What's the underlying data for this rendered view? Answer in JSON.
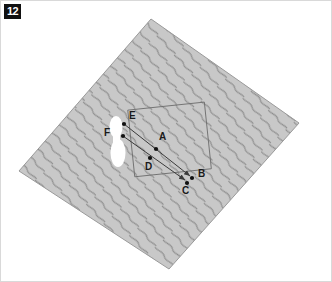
{
  "figure": {
    "number": "12",
    "label_color": "#111111",
    "label_text_color": "#ffffff"
  },
  "frame": {
    "border_color": "#d9d9d9",
    "background": "#ffffff",
    "width": 332,
    "height": 282
  },
  "diagram": {
    "name": "rotated-textured-square-with-labeled-points",
    "fill_color": "#c8c8c8",
    "texture_color": "#8c8c8c",
    "texture_type": "vertical-wavy-lines",
    "outline_color": "#9a9a9a",
    "square_corners": [
      {
        "x": 150,
        "y": 18
      },
      {
        "x": 298,
        "y": 122
      },
      {
        "x": 168,
        "y": 268
      },
      {
        "x": 18,
        "y": 170
      }
    ],
    "inner_rectangle": {
      "color": "#6e6e6e",
      "corners": [
        {
          "x": 130,
          "y": 105
        },
        {
          "x": 207,
          "y": 105
        },
        {
          "x": 207,
          "y": 172
        },
        {
          "x": 130,
          "y": 172
        }
      ]
    },
    "blobs": [
      {
        "name": "upper-white-blob",
        "cx": 115,
        "cy": 126,
        "rx": 6.5,
        "ry": 11,
        "color": "#ffffff"
      },
      {
        "name": "lower-white-blob",
        "cx": 117,
        "cy": 152,
        "rx": 7.5,
        "ry": 14,
        "color": "#ffffff"
      }
    ],
    "arrows": [
      {
        "name": "arrow-e-to-b",
        "from": "E",
        "to": "B",
        "x1": 123,
        "y1": 123,
        "x2": 191,
        "y2": 177,
        "color": "#3a3a3a"
      },
      {
        "name": "arrow-f-to-c",
        "from": "F",
        "to": "C",
        "x1": 122,
        "y1": 135,
        "x2": 186,
        "y2": 181,
        "color": "#3a3a3a"
      }
    ],
    "points": [
      {
        "id": "A",
        "label": "A",
        "x": 155,
        "y": 148,
        "label_x": 158,
        "label_y": 136
      },
      {
        "id": "B",
        "label": "B",
        "x": 191,
        "y": 177,
        "label_x": 197,
        "label_y": 172
      },
      {
        "id": "C",
        "label": "C",
        "x": 186,
        "y": 182,
        "label_x": 182,
        "label_y": 188
      },
      {
        "id": "D",
        "label": "D",
        "x": 149,
        "y": 157,
        "label_x": 145,
        "label_y": 163
      },
      {
        "id": "E",
        "label": "E",
        "x": 123,
        "y": 123,
        "label_x": 128,
        "label_y": 113
      },
      {
        "id": "F",
        "label": "F",
        "x": 122,
        "y": 135,
        "label_x": 104,
        "label_y": 130
      }
    ],
    "point_color": "#111111",
    "point_radius": 2.1
  }
}
